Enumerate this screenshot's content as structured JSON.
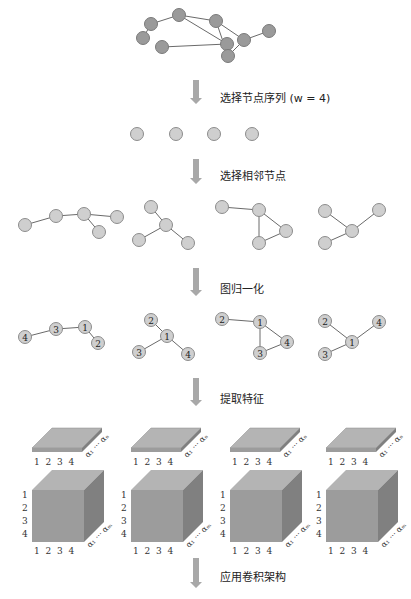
{
  "steps": [
    {
      "label": "选择节点序列 (w = 4)"
    },
    {
      "label": "选择相邻节点"
    },
    {
      "label": "图归一化"
    },
    {
      "label": "提取特征"
    },
    {
      "label": "应用卷积架构"
    }
  ],
  "input_graph": {
    "nodes": [
      [
        143,
        38
      ],
      [
        151,
        24
      ],
      [
        179,
        15
      ],
      [
        216,
        21
      ],
      [
        227,
        44
      ],
      [
        162,
        47
      ],
      [
        228,
        56
      ],
      [
        244,
        40
      ],
      [
        269,
        31
      ]
    ],
    "edges": [
      [
        0,
        1
      ],
      [
        1,
        2
      ],
      [
        2,
        3
      ],
      [
        2,
        4
      ],
      [
        4,
        5
      ],
      [
        4,
        6
      ],
      [
        3,
        6
      ],
      [
        3,
        7
      ],
      [
        6,
        7
      ],
      [
        7,
        8
      ]
    ]
  },
  "node_sequence": {
    "count": 4,
    "x": [
      137,
      176,
      214,
      252
    ],
    "y": 134
  },
  "neighborhoods": [
    {
      "nodes": [
        [
          25,
          225
        ],
        [
          56,
          216
        ],
        [
          84,
          214
        ],
        [
          117,
          217
        ],
        [
          99,
          232
        ]
      ],
      "edges": [
        [
          0,
          1
        ],
        [
          1,
          2
        ],
        [
          2,
          3
        ],
        [
          2,
          4
        ]
      ],
      "ranks": [
        "4",
        "3",
        "1",
        "",
        "2"
      ]
    },
    {
      "nodes": [
        [
          151,
          207
        ],
        [
          166,
          225
        ],
        [
          139,
          240
        ],
        [
          188,
          243
        ]
      ],
      "edges": [
        [
          0,
          1
        ],
        [
          1,
          2
        ],
        [
          1,
          3
        ]
      ],
      "ranks": [
        "2",
        "1",
        "3",
        "4"
      ]
    },
    {
      "nodes": [
        [
          222,
          207
        ],
        [
          259,
          210
        ],
        [
          259,
          243
        ],
        [
          286,
          231
        ]
      ],
      "edges": [
        [
          0,
          1
        ],
        [
          1,
          2
        ],
        [
          1,
          3
        ],
        [
          2,
          3
        ]
      ],
      "ranks": [
        "2",
        "1",
        "3",
        "4"
      ]
    },
    {
      "nodes": [
        [
          325,
          211
        ],
        [
          352,
          231
        ],
        [
          325,
          243
        ],
        [
          379,
          210
        ]
      ],
      "edges": [
        [
          0,
          1
        ],
        [
          1,
          2
        ],
        [
          1,
          3
        ]
      ],
      "ranks": [
        "2",
        "1",
        "3",
        "4"
      ]
    }
  ],
  "normalized": [
    {
      "nodes": [
        [
          25,
          337
        ],
        [
          56,
          329
        ],
        [
          85,
          327
        ],
        [
          98,
          343
        ]
      ],
      "edges": [
        [
          0,
          1
        ],
        [
          1,
          2
        ],
        [
          2,
          3
        ]
      ],
      "labels": [
        "4",
        "3",
        "1",
        "2"
      ]
    },
    {
      "nodes": [
        [
          151,
          320
        ],
        [
          167,
          336
        ],
        [
          139,
          352
        ],
        [
          188,
          354
        ]
      ],
      "edges": [
        [
          0,
          1
        ],
        [
          1,
          2
        ],
        [
          1,
          3
        ]
      ],
      "labels": [
        "2",
        "1",
        "3",
        "4"
      ]
    },
    {
      "nodes": [
        [
          222,
          319
        ],
        [
          260,
          322
        ],
        [
          260,
          353
        ],
        [
          287,
          342
        ]
      ],
      "edges": [
        [
          0,
          1
        ],
        [
          1,
          2
        ],
        [
          1,
          3
        ],
        [
          2,
          3
        ]
      ],
      "labels": [
        "2",
        "1",
        "3",
        "4"
      ]
    },
    {
      "nodes": [
        [
          325,
          321
        ],
        [
          352,
          342
        ],
        [
          325,
          354
        ],
        [
          379,
          322
        ]
      ],
      "edges": [
        [
          0,
          1
        ],
        [
          1,
          2
        ],
        [
          1,
          3
        ]
      ],
      "labels": [
        "2",
        "1",
        "3",
        "4"
      ]
    }
  ],
  "features": {
    "columns": [
      32,
      131,
      230,
      326
    ],
    "vertex_axis": [
      "1",
      "2",
      "3",
      "4"
    ],
    "node_axis": [
      "1",
      "2",
      "3",
      "4"
    ],
    "vertex_attr_label": "α₁ ··· αₙ",
    "edge_attr_label": "α₁ ··· αₘ"
  },
  "colors": {
    "node_input": "#9a9a9a",
    "node_light": "#cfcfcf",
    "arrow": "#a8a8a8",
    "cube_front": "#9c9c9c",
    "cube_top": "#b4b4b4",
    "cube_side": "#808080"
  }
}
